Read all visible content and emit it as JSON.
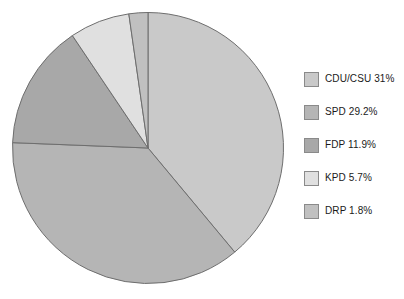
{
  "chart_data": {
    "type": "pie",
    "title": "",
    "subtitle": "",
    "xlabel": "",
    "ylabel": "",
    "legend_position": "right",
    "grid": false,
    "start_angle_deg": 0,
    "direction": "clockwise",
    "categories": [
      "CDU/CSU",
      "SPD",
      "FDP",
      "KPD",
      "DRP"
    ],
    "values": [
      31,
      29.2,
      11.9,
      5.7,
      1.8
    ],
    "value_unit": "%",
    "slices": [
      {
        "name": "CDU/CSU",
        "value": 31,
        "label": "CDU/CSU 31%",
        "color": "#c9c9c9"
      },
      {
        "name": "SPD",
        "value": 29.2,
        "label": "SPD 29.2%",
        "color": "#b5b5b5"
      },
      {
        "name": "FDP",
        "value": 11.9,
        "label": "FDP 11.9%",
        "color": "#a8a8a8"
      },
      {
        "name": "KPD",
        "value": 5.7,
        "label": "KPD 5.7%",
        "color": "#e0e0e0"
      },
      {
        "name": "DRP",
        "value": 1.8,
        "label": "DRP 1.8%",
        "color": "#c0c0c0"
      }
    ],
    "legend": [
      {
        "label": "CDU/CSU 31%",
        "color": "#c9c9c9"
      },
      {
        "label": "SPD 29.2%",
        "color": "#b5b5b5"
      },
      {
        "label": "FDP 11.9%",
        "color": "#a8a8a8"
      },
      {
        "label": "KPD 5.7%",
        "color": "#e0e0e0"
      },
      {
        "label": "DRP 1.8%",
        "color": "#c0c0c0"
      }
    ],
    "stroke_color": "#6e6e6e",
    "background_color": "#ffffff"
  }
}
